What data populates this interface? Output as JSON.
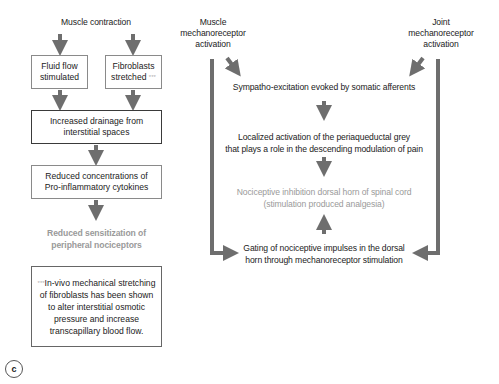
{
  "panel_label": "c",
  "left_flow": {
    "start": "Muscle contraction",
    "branch_left": [
      "Fluid flow",
      "stimulated"
    ],
    "branch_right": [
      "Fibroblasts",
      "stretched"
    ],
    "branch_right_marker": "***",
    "step3": [
      "Increased drainage from",
      "interstitial spaces"
    ],
    "step4": [
      "Reduced concentrations of",
      "Pro-inflammatory cytokines"
    ],
    "outcome": [
      "Reduced sensitization of",
      "peripheral nociceptors"
    ],
    "footnote_marker": "***",
    "footnote": [
      "In-vivo mechanical stretching",
      "of fibroblasts has been shown",
      "to alter interstitial osmotic",
      "pressure and increase",
      "transcapillary blood flow."
    ]
  },
  "right_flow": {
    "muscle_source": [
      "Muscle",
      "mechanoreceptor",
      "activation"
    ],
    "joint_source": [
      "Joint",
      "mechanoreceptor",
      "activation"
    ],
    "step1": "Sympatho-excitation evoked by somatic afferents",
    "step2": [
      "Localized activation of the periaqueductal grey",
      "that plays a role in the descending modulation of pain"
    ],
    "step3": [
      "Nociceptive inhibition dorsal horn of spinal cord",
      "(stimulation produced analgesia)"
    ],
    "step4": [
      "Gating of nociceptive impulses in the dorsal",
      "horn through mechanoreceptor stimulation"
    ]
  },
  "colors": {
    "arrow": "#6e6e6e",
    "box_border": "#8a8a8a",
    "box_border_dark": "#3a3a3a",
    "muted_text": "#9a9a9a",
    "text": "#222222"
  }
}
